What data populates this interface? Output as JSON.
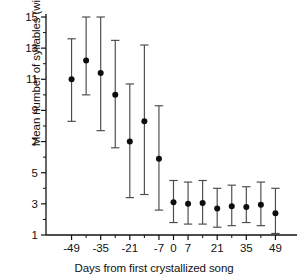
{
  "chart_data": {
    "type": "scatter",
    "title": "",
    "xlabel": "Days from first crystallized song",
    "ylabel": "Mean number of syllables (with sd)",
    "xlim": [
      -56,
      56
    ],
    "ylim": [
      1,
      15
    ],
    "grid": false,
    "legend": null,
    "x_ticks_labeled": [
      "-49",
      "-35",
      "-21",
      "-7",
      "0",
      "7",
      "21",
      "35",
      "49"
    ],
    "x_tick_values": [
      -49,
      -35,
      -21,
      -7,
      0,
      7,
      21,
      35,
      49
    ],
    "x_minor_tick_values": [
      -42,
      -28,
      -14,
      14,
      28,
      42
    ],
    "y_ticks_labeled": [
      "1",
      "3",
      "5",
      "7",
      "9",
      "11",
      "13",
      "15"
    ],
    "y_tick_values": [
      1,
      3,
      5,
      7,
      9,
      11,
      13,
      15
    ],
    "y_minor_tick_values": [
      2,
      4,
      6,
      8,
      10,
      12,
      14
    ],
    "error_bar_type": "sd",
    "marker": "filled-circle",
    "marker_color": "#0d0d0d",
    "error_color": "#4a4a4a",
    "x": [
      -49,
      -42,
      -35,
      -28,
      -21,
      -14,
      -7,
      0,
      7,
      14,
      21,
      28,
      35,
      42,
      49
    ],
    "values": [
      11.0,
      12.2,
      11.4,
      10.0,
      7.0,
      8.3,
      5.9,
      3.1,
      3.0,
      3.05,
      2.7,
      2.85,
      2.8,
      2.95,
      2.4
    ],
    "sd_lower": [
      8.3,
      10.0,
      7.7,
      6.6,
      3.4,
      3.6,
      2.6,
      1.8,
      1.7,
      1.7,
      1.5,
      1.6,
      1.8,
      1.6,
      1.1
    ],
    "sd_upper": [
      13.6,
      15.1,
      15.1,
      13.5,
      10.7,
      13.2,
      9.3,
      4.5,
      4.4,
      4.5,
      4.0,
      4.2,
      4.1,
      4.4,
      4.0
    ]
  }
}
